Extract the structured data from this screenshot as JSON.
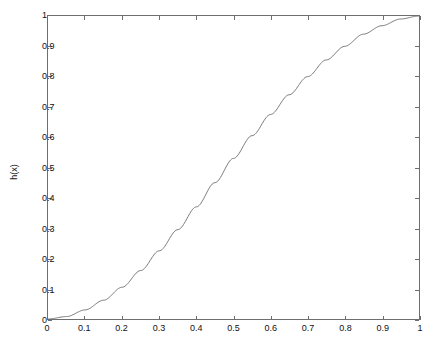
{
  "chart_data": {
    "type": "line",
    "title": "",
    "xlabel": "",
    "ylabel": "h(x)",
    "xlim": [
      0,
      1
    ],
    "ylim": [
      0,
      1
    ],
    "grid": false,
    "legend": null,
    "line_color": "#6b6b6b",
    "box_color": "#6e6e6e",
    "background": "#ffffff",
    "xticks": [
      "0",
      "0.1",
      "0.2",
      "0.3",
      "0.4",
      "0.5",
      "0.6",
      "0.7",
      "0.8",
      "0.9",
      "1"
    ],
    "xtick_values": [
      0,
      0.1,
      0.2,
      0.3,
      0.4,
      0.5,
      0.6,
      0.7,
      0.8,
      0.9,
      1
    ],
    "yticks": [
      "0",
      "0.1",
      "0.2",
      "0.3",
      "0.4",
      "0.5",
      "0.6",
      "0.7",
      "0.8",
      "0.9",
      "1"
    ],
    "ytick_values": [
      0,
      0.1,
      0.2,
      0.3,
      0.4,
      0.5,
      0.6,
      0.7,
      0.8,
      0.9,
      1
    ],
    "series": [
      {
        "name": "h(x)",
        "x": [
          0,
          0.05,
          0.1,
          0.15,
          0.2,
          0.25,
          0.3,
          0.35,
          0.4,
          0.45,
          0.5,
          0.55,
          0.6,
          0.65,
          0.7,
          0.75,
          0.8,
          0.85,
          0.9,
          0.95,
          1
        ],
        "values": [
          0.0,
          0.008,
          0.03,
          0.062,
          0.105,
          0.16,
          0.225,
          0.295,
          0.37,
          0.45,
          0.53,
          0.605,
          0.675,
          0.74,
          0.8,
          0.855,
          0.9,
          0.94,
          0.968,
          0.99,
          1.0
        ]
      }
    ]
  }
}
